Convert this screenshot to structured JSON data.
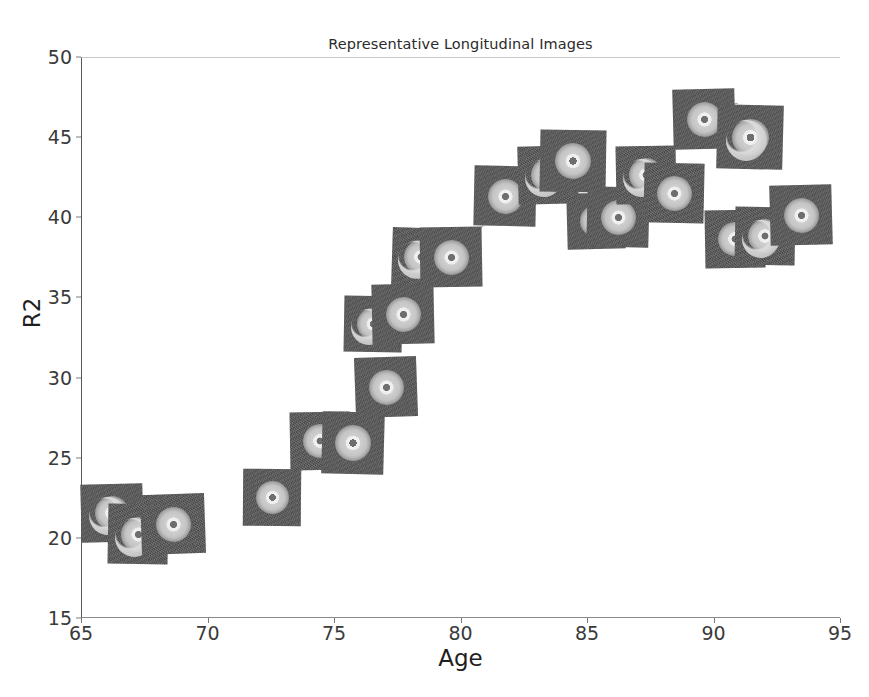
{
  "chart_data": {
    "type": "scatter",
    "title": "Representative Longitudinal Images",
    "xlabel": "Age",
    "ylabel": "R2",
    "xlim": [
      65,
      95
    ],
    "ylim": [
      15,
      50
    ],
    "xticks": [
      65,
      70,
      75,
      80,
      85,
      90,
      95
    ],
    "yticks": [
      15,
      20,
      25,
      30,
      35,
      40,
      45,
      50
    ],
    "grid": false,
    "legend": null,
    "marker_style": "image-thumbnail",
    "note": "Each data point is rendered as a grayscale longitudinal scan thumbnail; thin gray lines connect successive scans of the same subject.",
    "points": [
      {
        "x": 66.2,
        "y": 21.6,
        "w": 62,
        "h": 58,
        "rot": -1.5,
        "variant": "crescent",
        "z": 3
      },
      {
        "x": 67.2,
        "y": 20.3,
        "w": 60,
        "h": 60,
        "rot": 1.0,
        "variant": "crescent",
        "z": 4
      },
      {
        "x": 68.6,
        "y": 20.9,
        "w": 64,
        "h": 60,
        "rot": -2.0,
        "variant": "disc",
        "z": 5
      },
      {
        "x": 72.5,
        "y": 22.6,
        "w": 58,
        "h": 57,
        "rot": 0.5,
        "variant": "disc",
        "z": 6
      },
      {
        "x": 74.4,
        "y": 26.1,
        "w": 60,
        "h": 58,
        "rot": -1.0,
        "variant": "disc",
        "z": 7
      },
      {
        "x": 75.7,
        "y": 26.0,
        "w": 62,
        "h": 62,
        "rot": 1.5,
        "variant": "disc",
        "z": 8
      },
      {
        "x": 77.0,
        "y": 29.5,
        "w": 62,
        "h": 60,
        "rot": -2.0,
        "variant": "disc",
        "z": 9
      },
      {
        "x": 76.5,
        "y": 33.4,
        "w": 58,
        "h": 56,
        "rot": 1.0,
        "variant": "crescent",
        "z": 10
      },
      {
        "x": 77.7,
        "y": 34.0,
        "w": 62,
        "h": 60,
        "rot": -1.2,
        "variant": "disc",
        "z": 11
      },
      {
        "x": 78.4,
        "y": 37.6,
        "w": 58,
        "h": 58,
        "rot": 1.8,
        "variant": "crescent",
        "z": 12
      },
      {
        "x": 79.6,
        "y": 37.6,
        "w": 62,
        "h": 60,
        "rot": -1.0,
        "variant": "disc",
        "z": 13
      },
      {
        "x": 81.7,
        "y": 41.4,
        "w": 62,
        "h": 60,
        "rot": 1.2,
        "variant": "disc",
        "z": 14
      },
      {
        "x": 83.4,
        "y": 42.7,
        "w": 60,
        "h": 58,
        "rot": -1.5,
        "variant": "crescent",
        "z": 15
      },
      {
        "x": 84.4,
        "y": 43.6,
        "w": 66,
        "h": 62,
        "rot": 1.0,
        "variant": "disc",
        "z": 16
      },
      {
        "x": 85.3,
        "y": 39.8,
        "w": 58,
        "h": 56,
        "rot": -1.5,
        "variant": "disc",
        "z": 14
      },
      {
        "x": 86.2,
        "y": 40.1,
        "w": 62,
        "h": 60,
        "rot": 1.5,
        "variant": "disc",
        "z": 15
      },
      {
        "x": 87.3,
        "y": 42.7,
        "w": 60,
        "h": 58,
        "rot": -1.0,
        "variant": "crescent",
        "z": 16
      },
      {
        "x": 88.4,
        "y": 41.6,
        "w": 60,
        "h": 60,
        "rot": 1.2,
        "variant": "disc",
        "z": 17
      },
      {
        "x": 89.6,
        "y": 46.2,
        "w": 62,
        "h": 60,
        "rot": -1.5,
        "variant": "disc",
        "z": 18
      },
      {
        "x": 91.4,
        "y": 45.1,
        "w": 66,
        "h": 64,
        "rot": 1.5,
        "variant": "crescent",
        "z": 19
      },
      {
        "x": 90.8,
        "y": 38.7,
        "w": 60,
        "h": 58,
        "rot": -1.0,
        "variant": "disc",
        "z": 12
      },
      {
        "x": 92.0,
        "y": 38.9,
        "w": 60,
        "h": 58,
        "rot": 1.0,
        "variant": "crescent",
        "z": 13
      },
      {
        "x": 93.4,
        "y": 40.2,
        "w": 62,
        "h": 60,
        "rot": -1.5,
        "variant": "disc",
        "z": 14
      }
    ],
    "connectors": [
      {
        "x1": 68.3,
        "y1": 22.1,
        "x2": 69.3,
        "y2": 22.6
      },
      {
        "x1": 72.9,
        "y1": 22.9,
        "x2": 74.2,
        "y2": 25.3
      },
      {
        "x1": 75.0,
        "y1": 27.0,
        "x2": 76.4,
        "y2": 28.2
      },
      {
        "x1": 76.8,
        "y1": 30.4,
        "x2": 77.6,
        "y2": 30.9
      },
      {
        "x1": 77.0,
        "y1": 34.2,
        "x2": 78.2,
        "y2": 35.3
      },
      {
        "x1": 78.2,
        "y1": 38.0,
        "x2": 79.1,
        "y2": 38.6
      },
      {
        "x1": 79.9,
        "y1": 38.4,
        "x2": 81.2,
        "y2": 40.0
      },
      {
        "x1": 83.0,
        "y1": 43.3,
        "x2": 83.9,
        "y2": 43.9
      },
      {
        "x1": 85.0,
        "y1": 41.0,
        "x2": 85.9,
        "y2": 41.4
      },
      {
        "x1": 87.0,
        "y1": 43.3,
        "x2": 88.0,
        "y2": 43.1
      },
      {
        "x1": 89.9,
        "y1": 47.0,
        "x2": 90.9,
        "y2": 47.2
      },
      {
        "x1": 91.0,
        "y1": 39.4,
        "x2": 92.0,
        "y2": 39.6
      }
    ]
  },
  "colors": {
    "axis": "#585858",
    "tick_text": "#3a3a3a",
    "label_text": "#1f1f1f",
    "title_text": "#2b2b2b",
    "connector": "#a8a8a8",
    "thumb_background": "#595959",
    "thumb_disc_light": "#f2f2f2",
    "thumb_disc_mid": "#c4c4c4",
    "thumb_core": "#6e6e6e",
    "figure_background": "#ffffff"
  }
}
